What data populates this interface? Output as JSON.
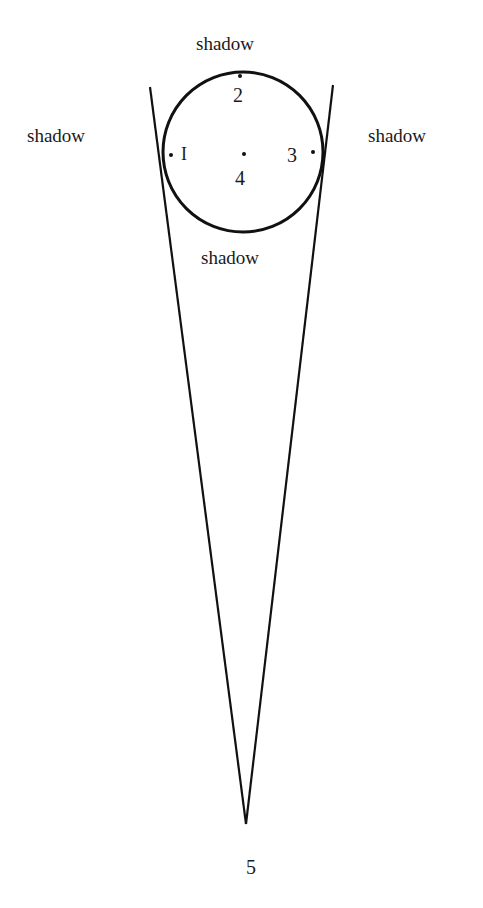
{
  "diagram": {
    "type": "eclipse-shadow-geometry",
    "labels": {
      "shadow_top": "shadow",
      "shadow_left": "shadow",
      "shadow_right": "shadow",
      "shadow_bottom": "shadow"
    },
    "points": [
      {
        "id": "1",
        "label": "I",
        "x": 171,
        "y": 155
      },
      {
        "id": "2",
        "label": "2",
        "x": 240,
        "y": 76
      },
      {
        "id": "3",
        "label": "3",
        "x": 313,
        "y": 152
      },
      {
        "id": "4",
        "label": "4",
        "x": 244,
        "y": 154
      },
      {
        "id": "5",
        "label": "5",
        "x": 246,
        "y": 824
      }
    ],
    "circle": {
      "cx": 243,
      "cy": 152,
      "r": 80
    },
    "cone": {
      "left_line": {
        "x1": 150,
        "y1": 87,
        "x2": 246,
        "y2": 824
      },
      "right_line": {
        "x1": 333,
        "y1": 85,
        "x2": 246,
        "y2": 824
      }
    },
    "stroke_color": "#111111"
  }
}
